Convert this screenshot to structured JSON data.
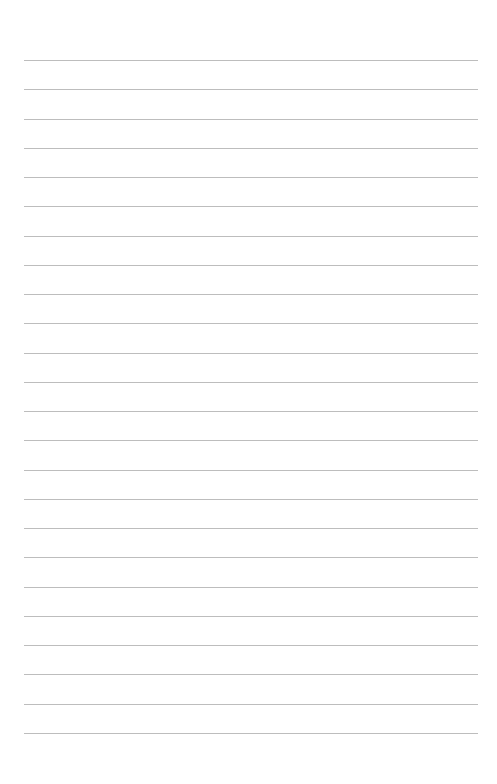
{
  "page": {
    "type": "lined-paper",
    "line_count": 24,
    "first_line_y": 60,
    "line_spacing": 29.26,
    "line_left": 24,
    "line_width": 454,
    "line_color": "#bdbdbd",
    "background": "#ffffff"
  }
}
